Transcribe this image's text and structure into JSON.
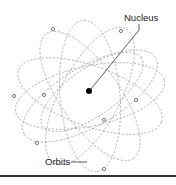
{
  "diagram": {
    "type": "atom-model",
    "labels": {
      "nucleus": "Nucleus",
      "orbits": "Orbits"
    },
    "colors": {
      "orbit": "#9a9a9a",
      "nucleus": "#000000",
      "electron_stroke": "#555555",
      "text": "#222222"
    },
    "nucleus": {
      "x": 89,
      "y": 91,
      "r": 3
    },
    "electron_count": 8
  }
}
